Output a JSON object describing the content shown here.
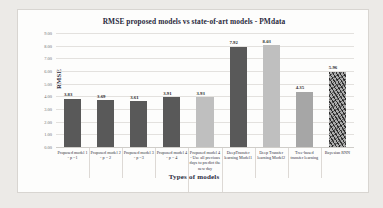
{
  "chart_data": {
    "type": "bar",
    "title": "RMSE proposed models vs state-of-art models - PMdata",
    "xlabel": "Types of models",
    "ylabel": "RMSE",
    "ylim": [
      0,
      9
    ],
    "ytick_labels": [
      "9.00",
      "8.00",
      "7.00",
      "6.00",
      "5.00",
      "4.00",
      "3.00",
      "2.00",
      "1.00",
      "0.00"
    ],
    "ytick_values": [
      9,
      8,
      7,
      6,
      5,
      4,
      3,
      2,
      1,
      0
    ],
    "grid": true,
    "legend": "none",
    "categories": [
      "Proposed model 1 - p =1",
      "Proposed model 2 - p = 2",
      "Proposed model 3 -  p =3",
      "Proposed model 4 - p = 4",
      "Proposed model 4 - Use all previous days to predict the new day",
      "DeepTransfer learning Model1",
      "Deep Transfer learning Model2",
      "Tree-based transfer learning",
      "Bayesian RNN"
    ],
    "values": [
      3.83,
      3.69,
      3.61,
      3.91,
      3.93,
      7.92,
      8.03,
      4.35,
      5.96
    ],
    "value_labels": [
      "3.83",
      "3.69",
      "3.61",
      "3.91",
      "3.93",
      "7.92",
      "8.03",
      "4.35",
      "5.96"
    ],
    "bar_styles": [
      "dark",
      "dark",
      "dark",
      "dark",
      "light",
      "dark",
      "light",
      "mid",
      "tex"
    ],
    "colors": {
      "dark": "#595959",
      "light": "#bfbfbf",
      "mid": "#a6a6a6",
      "textured": "#8c8c8c",
      "title_text": "#2a2a3d",
      "grid": "#e3e1de",
      "plot_background": "#fdfdfc",
      "page_background": "#eceae7"
    }
  }
}
